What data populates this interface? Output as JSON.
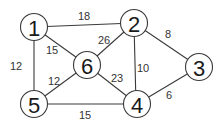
{
  "graph": {
    "title": "",
    "nodes": [
      {
        "id": "1",
        "label": "1",
        "x": 34,
        "y": 27
      },
      {
        "id": "2",
        "label": "2",
        "x": 134,
        "y": 23
      },
      {
        "id": "3",
        "label": "3",
        "x": 199,
        "y": 67
      },
      {
        "id": "4",
        "label": "4",
        "x": 137,
        "y": 104
      },
      {
        "id": "5",
        "label": "5",
        "x": 34,
        "y": 104
      },
      {
        "id": "6",
        "label": "6",
        "x": 87,
        "y": 65
      }
    ],
    "edges": [
      {
        "from": "1",
        "to": "2",
        "weight": "18",
        "lx": 84,
        "ly": 16
      },
      {
        "from": "1",
        "to": "5",
        "weight": "12",
        "lx": 16,
        "ly": 66
      },
      {
        "from": "1",
        "to": "6",
        "weight": "15",
        "lx": 52,
        "ly": 50
      },
      {
        "from": "2",
        "to": "6",
        "weight": "26",
        "lx": 104,
        "ly": 40
      },
      {
        "from": "2",
        "to": "4",
        "weight": "10",
        "lx": 143,
        "ly": 68
      },
      {
        "from": "2",
        "to": "3",
        "weight": "8",
        "lx": 168,
        "ly": 34
      },
      {
        "from": "6",
        "to": "5",
        "weight": "12",
        "lx": 54,
        "ly": 81
      },
      {
        "from": "6",
        "to": "4",
        "weight": "23",
        "lx": 117,
        "ly": 78
      },
      {
        "from": "5",
        "to": "4",
        "weight": "15",
        "lx": 85,
        "ly": 115
      },
      {
        "from": "4",
        "to": "3",
        "weight": "6",
        "lx": 169,
        "ly": 95
      }
    ],
    "colors": {
      "stroke": "#3a3a3a",
      "text": "#1a1a1a",
      "background": "#ffffff"
    }
  }
}
